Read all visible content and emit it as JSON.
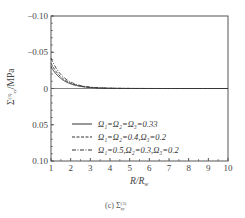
{
  "chart_data": {
    "type": "line",
    "title": "",
    "caption": "(c) Σ_xy^(3)",
    "xlabel": "R/R_w",
    "ylabel": "Σ_xy^(3)/MPa",
    "xlim": [
      1,
      10
    ],
    "ylim": [
      -0.1,
      0.1
    ],
    "y_inverted": true,
    "x_ticks": [
      "1",
      "2",
      "3",
      "4",
      "5",
      "6",
      "7",
      "8",
      "9",
      "10"
    ],
    "y_ticks": [
      "-0.10",
      "-0.05",
      "0",
      "0.05",
      "0.10"
    ],
    "grid": false,
    "legend_position": "lower-left inside",
    "x": [
      1.0,
      1.2,
      1.5,
      2.0,
      2.5,
      3.0,
      3.5,
      4.0,
      5.0,
      6.0,
      7.0,
      8.0,
      9.0,
      10.0
    ],
    "series": [
      {
        "name": "Ω1=Ω2=Ω3=0.33",
        "style": "solid",
        "values": [
          -0.03,
          -0.022,
          -0.014,
          -0.007,
          -0.003,
          -0.001,
          0.0,
          0.0,
          0.0,
          0.0,
          0.0,
          0.0,
          0.0,
          0.0
        ]
      },
      {
        "name": "Ω1=Ω2=0.4, Ω3=0.2",
        "style": "dashed",
        "values": [
          -0.035,
          -0.024,
          -0.015,
          -0.007,
          -0.003,
          -0.001,
          0.0,
          0.0,
          0.0,
          0.0,
          0.0,
          0.0,
          0.0,
          0.0
        ]
      },
      {
        "name": "Ω1=0.5, Ω2=0.3, Ω3=0.2",
        "style": "dashdot",
        "values": [
          -0.042,
          -0.026,
          -0.016,
          -0.008,
          -0.003,
          -0.001,
          0.0,
          0.0,
          0.0,
          0.0,
          0.0,
          0.0,
          0.0,
          0.0
        ]
      }
    ]
  },
  "labels": {
    "xlabel": "R/R",
    "xlabel_sub": "w",
    "ylabel": "Σ",
    "ylabel_suffix": "/MPa",
    "caption_prefix": "(c) Σ",
    "caption_sup": "(3)",
    "caption_sub": "xy",
    "legend": [
      "Ω₁=Ω₂=Ω₃=0.33",
      "Ω₁=Ω₂=0.4,Ω₃=0.2",
      "Ω₁=0.5,Ω₂=0.3,Ω₃=0.2"
    ],
    "y_ticks": [
      "-0.10",
      "-0.05",
      "0",
      "0.05",
      "0.10"
    ],
    "x_ticks": [
      "1",
      "2",
      "3",
      "4",
      "5",
      "6",
      "7",
      "8",
      "9",
      "10"
    ]
  }
}
